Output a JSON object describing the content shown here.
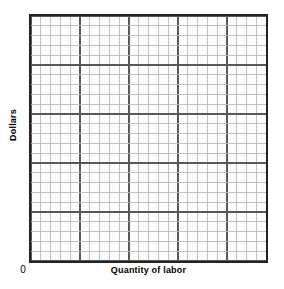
{
  "chart_data": {
    "type": "line",
    "title": "",
    "subtitle": "",
    "xlabel": "Quantity of labor",
    "ylabel": "Dollars",
    "origin_label": "0",
    "series": [],
    "categories": [],
    "x": [],
    "values": [],
    "xlim": [
      0,
      24
    ],
    "ylim": [
      0,
      25
    ],
    "xtick_labels": [],
    "ytick_labels": [],
    "grid": true,
    "grid_columns": 24,
    "grid_rows": 25,
    "grid_cell_px": 10,
    "grid_major_every": 5,
    "legend": [],
    "legend_position": "none",
    "annotations": [],
    "note": "Empty graph-paper plot area with no plotted data"
  },
  "axes": {
    "y_label": "Dollars",
    "x_label": "Quantity of labor",
    "origin": "0"
  },
  "colors": {
    "background": "#ffffff",
    "plot_background": "#fdfdfd",
    "border": "#222222",
    "grid_minor": "#b9b9b9",
    "grid_major": "#585858",
    "text": "#000000"
  }
}
